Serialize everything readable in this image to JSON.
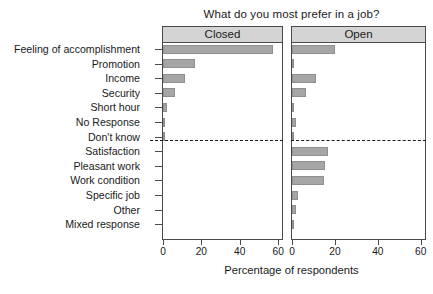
{
  "chart_data": {
    "type": "bar",
    "title": "What do you most prefer in a job?",
    "xlabel": "Percentage of respondents",
    "ylabel": "",
    "orientation": "horizontal",
    "xlim": [
      0,
      62
    ],
    "xticks": [
      0,
      20,
      40,
      60
    ],
    "xticklabels": [
      "0",
      "20",
      "40",
      "60"
    ],
    "grid": false,
    "legend": null,
    "panels": [
      {
        "key": "closed",
        "label": "Closed"
      },
      {
        "key": "open",
        "label": "Open"
      }
    ],
    "categories": [
      "Feeling of accomplishment",
      "Promotion",
      "Income",
      "Security",
      "Short hour",
      "No Response",
      "Don't know",
      "Satisfaction",
      "Pleasant work",
      "Work condition",
      "Specific job",
      "Other",
      "Mixed response"
    ],
    "series": [
      {
        "name": "Closed",
        "values": [
          57.5,
          16.5,
          11.5,
          6.5,
          2.0,
          0.8,
          0.3,
          0,
          0,
          0,
          0,
          0,
          0
        ]
      },
      {
        "name": "Open",
        "values": [
          20.0,
          1.0,
          11.0,
          6.5,
          0.5,
          2.0,
          0.8,
          17.0,
          15.5,
          15.0,
          3.0,
          2.0,
          1.0
        ]
      }
    ],
    "annotations": [
      {
        "type": "dashed-horizontal-separator",
        "after_category": "Don't know",
        "note": "separates closed-question response options from open-question response options"
      }
    ],
    "colors": {
      "bar_fill": "#a6a6a6",
      "bar_edge": "#8f8f8f",
      "panel_strip": "#d4d4d4",
      "axis": "#4a4a4a",
      "text": "#1a1a1a",
      "background": "#ffffff"
    }
  }
}
